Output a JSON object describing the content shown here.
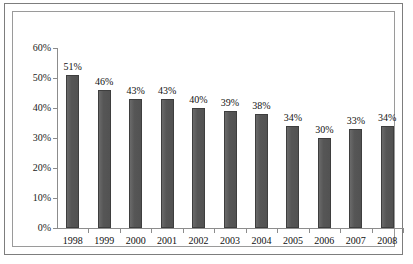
{
  "chart_data": {
    "type": "bar",
    "title": "",
    "subtitle": "",
    "xlabel": "",
    "ylabel": "",
    "categories": [
      "1998",
      "1999",
      "2000",
      "2001",
      "2002",
      "2003",
      "2004",
      "2005",
      "2006",
      "2007",
      "2008"
    ],
    "values": [
      51,
      46,
      43,
      43,
      40,
      39,
      38,
      34,
      30,
      33,
      34
    ],
    "data_labels": [
      "51%",
      "46%",
      "43%",
      "43%",
      "40%",
      "39%",
      "38%",
      "34%",
      "30%",
      "33%",
      "34%"
    ],
    "ylim": [
      0,
      60
    ],
    "ytick_values": [
      0,
      10,
      20,
      30,
      40,
      50,
      60
    ],
    "ytick_labels": [
      "0%",
      "10%",
      "20%",
      "30%",
      "40%",
      "50%",
      "60%"
    ],
    "grid": false,
    "legend": null,
    "legend_position": "none",
    "series": [
      {
        "name": "",
        "values": [
          51,
          46,
          43,
          43,
          40,
          39,
          38,
          34,
          30,
          33,
          34
        ],
        "color": "#5a5a5a"
      }
    ],
    "colors": {
      "bar_fill": "#5a5a5a",
      "bar_border": "#3e3e3e",
      "axis": "#8c8c8c",
      "text": "#111111",
      "plot_background": "#ffffff",
      "outer_border": "#7d7d7d",
      "plot_border": "#9a9a9a"
    }
  }
}
